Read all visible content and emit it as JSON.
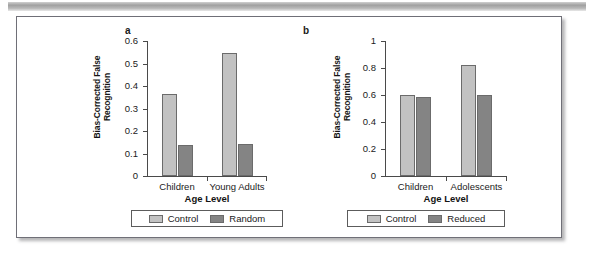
{
  "figure": {
    "colors": {
      "control_fill": "#c2c2c2",
      "treatment_fill": "#848484",
      "axis": "#4a4a4a",
      "text": "#1a1a1a",
      "frame_border": "#6f6f77"
    }
  },
  "chart_data": [
    {
      "type": "bar",
      "panel_label": "a",
      "title": "",
      "xlabel": "Age Level",
      "ylabel": "Bias-Corrected False\nRecognition",
      "categories": [
        "Children",
        "Young Adults"
      ],
      "series": [
        {
          "name": "Control",
          "values": [
            0.365,
            0.545
          ],
          "color": "#c2c2c2"
        },
        {
          "name": "Random",
          "values": [
            0.14,
            0.142
          ],
          "color": "#848484"
        }
      ],
      "ylim": [
        0,
        0.6
      ],
      "yticks": [
        0,
        0.1,
        0.2,
        0.3,
        0.4,
        0.5,
        0.6
      ],
      "ytick_labels": [
        "0",
        "0.1",
        "0.2",
        "0.3",
        "0.4",
        "0.5",
        "0.6"
      ],
      "grid": false,
      "legend_position": "below"
    },
    {
      "type": "bar",
      "panel_label": "b",
      "title": "",
      "xlabel": "Age Level",
      "ylabel": "Bias-Corrected False\nRecognition",
      "categories": [
        "Children",
        "Adolescents"
      ],
      "series": [
        {
          "name": "Control",
          "values": [
            0.6,
            0.82
          ],
          "color": "#c2c2c2"
        },
        {
          "name": "Reduced",
          "values": [
            0.585,
            0.6
          ],
          "color": "#848484"
        }
      ],
      "ylim": [
        0,
        1
      ],
      "yticks": [
        0,
        0.2,
        0.4,
        0.6,
        0.8,
        1
      ],
      "ytick_labels": [
        "0",
        "0.2",
        "0.4",
        "0.6",
        "0.8",
        "1"
      ],
      "grid": false,
      "legend_position": "below"
    }
  ]
}
